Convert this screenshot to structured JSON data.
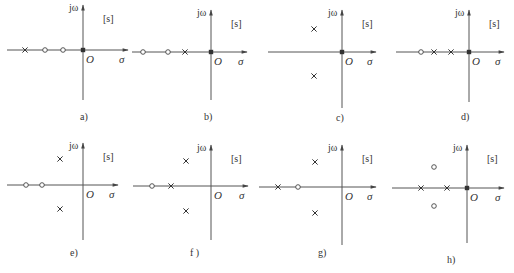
{
  "figure": {
    "axis_labels": {
      "imag": "jω",
      "real": "σ",
      "origin": "O",
      "plane": "[s]"
    },
    "legend": {
      "pole_symbol": "×",
      "zero_symbol": "○"
    },
    "colors": {
      "axis": "#555555",
      "marker": "#333333",
      "text": "#333333",
      "background": "#ffffff"
    },
    "panels": [
      {
        "id": "a",
        "caption": "a)",
        "origin": [
          83,
          50
        ],
        "axis_x": [
          7,
          128
        ],
        "axis_y": [
          5,
          100
        ],
        "caption_pos": [
          80,
          120
        ],
        "poles": [
          [
            25,
            50
          ],
          [
            83,
            50
          ]
        ],
        "zeros": [
          [
            45,
            50
          ],
          [
            63,
            50
          ]
        ]
      },
      {
        "id": "b",
        "caption": "b)",
        "origin": [
          211,
          52
        ],
        "axis_x": [
          132,
          247
        ],
        "axis_y": [
          10,
          100
        ],
        "caption_pos": [
          204,
          120
        ],
        "poles": [
          [
            185,
            52
          ],
          [
            211,
            52
          ]
        ],
        "zeros": [
          [
            143,
            52
          ],
          [
            168,
            52
          ]
        ]
      },
      {
        "id": "c",
        "caption": "c)",
        "origin": [
          342,
          52
        ],
        "axis_x": [
          268,
          376
        ],
        "axis_y": [
          10,
          108
        ],
        "caption_pos": [
          336,
          121
        ],
        "poles": [
          [
            314,
            29
          ],
          [
            314,
            76
          ],
          [
            342,
            52
          ]
        ],
        "zeros": []
      },
      {
        "id": "d",
        "caption": "d)",
        "origin": [
          469,
          52
        ],
        "axis_x": [
          396,
          504
        ],
        "axis_y": [
          10,
          102
        ],
        "caption_pos": [
          461,
          120
        ],
        "poles": [
          [
            434,
            52
          ],
          [
            451,
            52
          ],
          [
            469,
            52
          ]
        ],
        "zeros": [
          [
            421,
            52
          ]
        ]
      },
      {
        "id": "e",
        "caption": "e)",
        "origin": [
          83,
          185
        ],
        "axis_x": [
          7,
          118
        ],
        "axis_y": [
          143,
          240
        ],
        "caption_pos": [
          70,
          256
        ],
        "poles": [
          [
            60,
            159
          ],
          [
            60,
            209
          ]
        ],
        "zeros": [
          [
            26,
            185
          ],
          [
            42,
            185
          ]
        ]
      },
      {
        "id": "f",
        "caption": "f )",
        "origin": [
          211,
          186
        ],
        "axis_x": [
          133,
          248
        ],
        "axis_y": [
          145,
          240
        ],
        "caption_pos": [
          190,
          256
        ],
        "poles": [
          [
            171,
            186
          ],
          [
            186,
            161
          ],
          [
            186,
            211
          ]
        ],
        "zeros": [
          [
            152,
            186
          ]
        ]
      },
      {
        "id": "g",
        "caption": "g)",
        "origin": [
          342,
          187
        ],
        "axis_x": [
          259,
          376
        ],
        "axis_y": [
          145,
          245
        ],
        "caption_pos": [
          318,
          256
        ],
        "poles": [
          [
            278,
            187
          ],
          [
            315,
            162
          ],
          [
            315,
            213
          ]
        ],
        "zeros": [
          [
            298,
            187
          ]
        ]
      },
      {
        "id": "h",
        "caption": "h)",
        "origin": [
          467,
          188
        ],
        "axis_x": [
          392,
          504
        ],
        "axis_y": [
          145,
          243
        ],
        "caption_pos": [
          447,
          263
        ],
        "poles": [
          [
            421,
            188
          ],
          [
            447,
            188
          ],
          [
            467,
            188
          ]
        ],
        "zeros": [
          [
            434,
            167
          ],
          [
            434,
            206
          ]
        ]
      }
    ]
  }
}
